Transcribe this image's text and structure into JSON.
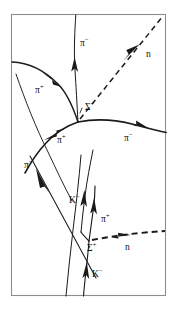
{
  "figure": {
    "type": "bubble-chamber-event-diagram",
    "frame": {
      "x": 11,
      "y": 14,
      "width": 155,
      "height": 282,
      "border_color": "#8d8d8d"
    },
    "background_color": "#ffffff",
    "ink_color": "#1a1a1a"
  },
  "labels": {
    "pi_minus_top": {
      "symbol": "π",
      "charge": "−",
      "full": "π−",
      "x": 80,
      "y": 46
    },
    "neutron_top": {
      "symbol": "n",
      "charge": "",
      "full": "n",
      "x": 146,
      "y": 57
    },
    "pi_plus_upper_left": {
      "symbol": "π",
      "charge": "+",
      "full": "π+",
      "x": 35,
      "y": 93
    },
    "sigma_minus_vertex": {
      "symbol": "Σ",
      "charge": "−",
      "full": "Σ−",
      "x": 85,
      "y": 110
    },
    "pi_plus_mid_left": {
      "symbol": "π",
      "charge": "+",
      "full": "π+",
      "x": 57,
      "y": 143
    },
    "pi_minus_right": {
      "symbol": "π",
      "charge": "−",
      "full": "π−",
      "x": 124,
      "y": 141
    },
    "pi_minus_lower_left": {
      "symbol": "π",
      "charge": "−",
      "full": "π−",
      "x": 24,
      "y": 168
    },
    "k_minus_mid": {
      "symbol": "K",
      "charge": "−",
      "full": "K−",
      "x": 69,
      "y": 203
    },
    "pi_plus_lower": {
      "symbol": "π",
      "charge": "+",
      "full": "π+",
      "x": 101,
      "y": 222
    },
    "sigma_plus_vertex": {
      "symbol": "Σ",
      "charge": "+",
      "full": "Σ+",
      "x": 87,
      "y": 251
    },
    "neutron_lower": {
      "symbol": "n",
      "charge": "",
      "full": "n",
      "x": 125,
      "y": 250
    },
    "k_minus_bottom": {
      "symbol": "K",
      "charge": "−",
      "full": "K−",
      "x": 92,
      "y": 277
    }
  },
  "tracks": {
    "pi_minus_top_track": {
      "name": "pi-minus-top",
      "style": "solid",
      "width": 1.0
    },
    "neutron_top_track": {
      "name": "neutron-top",
      "style": "dashed",
      "width": 1.5
    },
    "pi_plus_upper_left_track": {
      "name": "pi-plus-upper-left",
      "style": "solid",
      "width": 1.4
    },
    "pi_minus_right_track": {
      "name": "pi-minus-right",
      "style": "solid",
      "width": 1.6
    },
    "pi_plus_mid_track": {
      "name": "pi-plus-mid",
      "style": "solid",
      "width": 1.0
    },
    "pi_minus_lower_left_track": {
      "name": "pi-minus-lower-left",
      "style": "solid",
      "width": 1.0
    },
    "k_minus_incoming_track": {
      "name": "k-minus-incoming",
      "style": "solid",
      "width": 1.0
    },
    "pi_plus_sigma_track": {
      "name": "pi-plus-from-sigma",
      "style": "solid",
      "width": 1.0
    },
    "neutron_lower_track": {
      "name": "neutron-lower",
      "style": "dashed",
      "width": 1.8
    },
    "sigma_plus_track": {
      "name": "sigma-plus-short",
      "style": "solid",
      "width": 1.2
    },
    "k_minus_bottom_track": {
      "name": "k-minus-bottom",
      "style": "solid",
      "width": 1.0
    }
  },
  "vertices": {
    "sigma_minus": {
      "x": 78,
      "y": 122
    },
    "sigma_plus": {
      "x": 89,
      "y": 241
    }
  }
}
